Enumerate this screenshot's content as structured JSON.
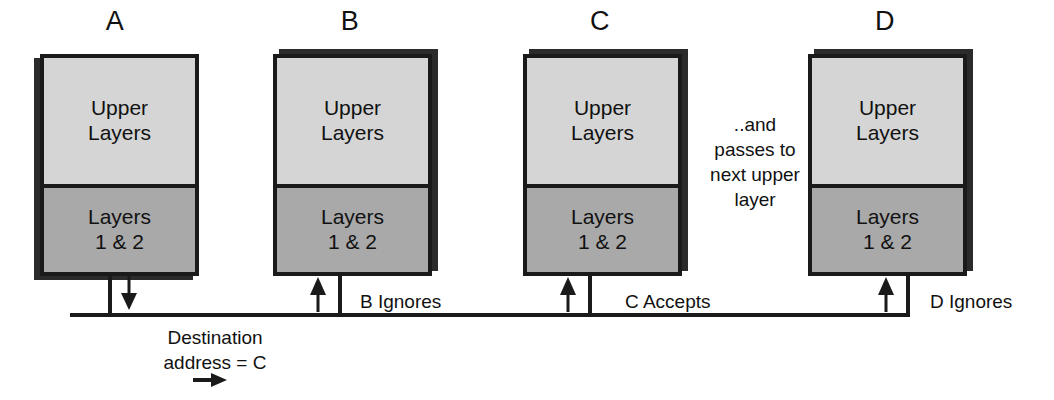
{
  "diagram": {
    "colors": {
      "upper_fill": "#d5d5d5",
      "lower_fill": "#a9a9a9",
      "stroke": "#1a1a1a",
      "shadow": "#2b2b2b",
      "background": "#ffffff"
    },
    "stations": [
      {
        "id": "A",
        "label": "A",
        "upper_line1": "Upper",
        "upper_line2": "Layers",
        "lower_line1": "Layers",
        "lower_line2": "1 & 2",
        "arrow_direction": "down",
        "bus_note": ""
      },
      {
        "id": "B",
        "label": "B",
        "upper_line1": "Upper",
        "upper_line2": "Layers",
        "lower_line1": "Layers",
        "lower_line2": "1 & 2",
        "arrow_direction": "up",
        "bus_note": "B Ignores"
      },
      {
        "id": "C",
        "label": "C",
        "upper_line1": "Upper",
        "upper_line2": "Layers",
        "lower_line1": "Layers",
        "lower_line2": "1 & 2",
        "arrow_direction": "up",
        "bus_note": "C Accepts"
      },
      {
        "id": "D",
        "label": "D",
        "upper_line1": "Upper",
        "upper_line2": "Layers",
        "lower_line1": "Layers",
        "lower_line2": "1 & 2",
        "arrow_direction": "up",
        "bus_note": "D Ignores"
      }
    ],
    "annotations": {
      "pass_up_line1": "..and",
      "pass_up_line2": "passes to",
      "pass_up_line3": "next upper",
      "pass_up_line4": "layer",
      "destination_line1": "Destination",
      "destination_line2": "address  = C"
    }
  }
}
